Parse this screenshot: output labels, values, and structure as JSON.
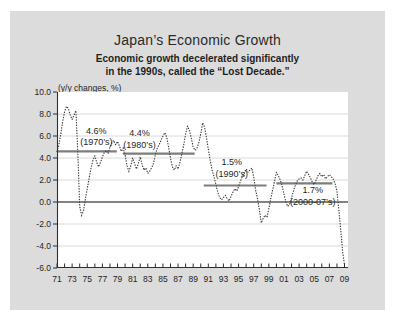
{
  "slide": {
    "title": "Japan’s Economic Growth",
    "subtitle_line1": "Economic growth decelerated significantly",
    "subtitle_line2": "in the 1990s, called the “Lost Decade.”",
    "axis_unit_label": "(y/y changes, %)"
  },
  "colors": {
    "page_bg": "#ffffff",
    "slide_bg": "#dcdcdc",
    "plot_bg": "#ffffff",
    "grid": "#d6d6d6",
    "zero_line": "#5a5a5a",
    "average_line": "#7d7d7d",
    "curve": "#3f3f3f",
    "axis": "#2f2f2f",
    "text": "#1f1f1f"
  },
  "chart_data": {
    "type": "line",
    "line_style": "dotted",
    "title": "Japan’s Economic Growth",
    "subtitle": "Economic growth decelerated significantly in the 1990s, called the “Lost Decade.”",
    "ylabel": "(y/y changes, %)",
    "ylim": [
      -6.0,
      10.0
    ],
    "y_tick_step": 2.0,
    "y_tick_labels": [
      "10.0",
      "8.0",
      "6.0",
      "4.0",
      "2.0",
      "0.0",
      "-2.0",
      "-4.0",
      "-6.0"
    ],
    "x_tick_labels": [
      "71",
      "73",
      "75",
      "77",
      "79",
      "81",
      "83",
      "85",
      "87",
      "89",
      "91",
      "93",
      "95",
      "97",
      "99",
      "01",
      "03",
      "05",
      "07",
      "09"
    ],
    "x_start_year": 1971,
    "x_end_year": 2009,
    "points_per_year": 4,
    "grid": "horizontal-only",
    "zero_line_value": 0.0,
    "series": [
      {
        "name": "Real GDP growth (y/y % change, quarterly)",
        "values": [
          4.6,
          5.2,
          6.2,
          7.3,
          8.2,
          8.7,
          8.5,
          7.9,
          7.5,
          7.9,
          8.3,
          4.5,
          -0.4,
          -1.2,
          -0.8,
          0.3,
          1.2,
          2.2,
          3.1,
          3.8,
          4.2,
          3.6,
          3.2,
          3.6,
          4.1,
          4.5,
          4.7,
          4.4,
          5.0,
          5.4,
          5.6,
          5.2,
          5.5,
          5.1,
          4.6,
          4.9,
          4.3,
          3.3,
          2.8,
          3.3,
          4.0,
          3.5,
          3.0,
          3.5,
          4.1,
          3.4,
          2.9,
          3.1,
          2.6,
          2.8,
          3.1,
          3.5,
          4.3,
          4.9,
          5.2,
          5.6,
          6.0,
          6.3,
          5.9,
          5.0,
          4.0,
          3.2,
          2.9,
          3.3,
          3.0,
          3.6,
          4.4,
          5.2,
          6.2,
          6.9,
          6.5,
          5.8,
          5.0,
          4.7,
          4.9,
          5.4,
          6.2,
          7.2,
          6.8,
          5.9,
          4.8,
          3.8,
          2.9,
          2.3,
          1.6,
          0.9,
          0.4,
          0.2,
          0.4,
          0.6,
          0.3,
          0.1,
          0.5,
          0.9,
          1.2,
          1.0,
          1.4,
          1.9,
          2.3,
          2.6,
          3.0,
          2.7,
          2.9,
          3.1,
          2.3,
          1.1,
          0.3,
          -0.7,
          -1.9,
          -1.5,
          -1.2,
          -1.4,
          -0.6,
          0.3,
          1.1,
          1.9,
          2.7,
          2.4,
          2.0,
          1.5,
          0.7,
          0.0,
          -0.4,
          -0.2,
          0.4,
          1.0,
          1.5,
          1.9,
          2.1,
          2.2,
          2.0,
          2.4,
          2.8,
          2.5,
          2.2,
          1.8,
          1.6,
          2.0,
          2.4,
          2.6,
          2.3,
          2.5,
          2.1,
          2.3,
          2.5,
          2.3,
          2.1,
          1.7,
          1.0,
          -0.7,
          -2.5,
          -4.5,
          -5.7
        ]
      }
    ],
    "averages": [
      {
        "label": "4.6%",
        "sublabel": "(1970’s)",
        "value": 4.6,
        "from_year": 1971.1,
        "to_year": 1978.9,
        "label_center_year": 1976.2
      },
      {
        "label": "4.4%",
        "sublabel": "(1980’s)",
        "value": 4.4,
        "from_year": 1979.7,
        "to_year": 1989.2,
        "label_center_year": 1981.9
      },
      {
        "label": "1.5%",
        "sublabel": "(1990’s)",
        "value": 1.5,
        "from_year": 1990.4,
        "to_year": 1998.7,
        "label_center_year": 1994.1
      },
      {
        "label": "1.7%",
        "sublabel": "(2000-07’s)",
        "value": 1.7,
        "from_year": 2000.0,
        "to_year": 2007.4,
        "label_center_year": 2004.8
      }
    ]
  }
}
